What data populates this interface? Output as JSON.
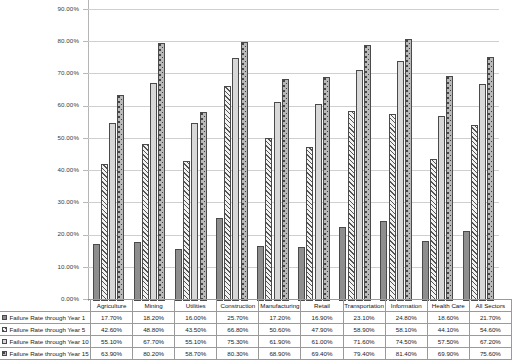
{
  "chart_data": {
    "type": "bar",
    "title": "",
    "xlabel": "",
    "ylabel": "",
    "ylim": [
      0,
      90
    ],
    "grid": true,
    "legend_position": "bottom-table",
    "categories": [
      "Agriculture",
      "Mining",
      "Utilities",
      "Construction",
      "Manufacturing",
      "Retail",
      "Transportation",
      "Information",
      "Health Care",
      "All Sectors"
    ],
    "ytick_labels": [
      "90.00%",
      "80.00%",
      "70.00%",
      "60.00%",
      "50.00%",
      "40.00%",
      "30.00%",
      "20.00%",
      "10.00%",
      "0.00%"
    ],
    "ytick_values": [
      90,
      80,
      70,
      60,
      50,
      40,
      30,
      20,
      10,
      0
    ],
    "series": [
      {
        "name": "Failure Rate through Year 1",
        "pattern": "solid-gray",
        "values": [
          17.7,
          18.2,
          16.0,
          25.7,
          17.2,
          16.9,
          23.1,
          24.8,
          18.6,
          21.7
        ],
        "labels": [
          "17.70%",
          "18.20%",
          "16.00%",
          "25.70%",
          "17.20%",
          "16.90%",
          "23.10%",
          "24.80%",
          "18.60%",
          "21.70%"
        ]
      },
      {
        "name": "Failure Rate through Year 5",
        "pattern": "diagonal-hatch",
        "values": [
          42.6,
          48.8,
          43.5,
          66.8,
          50.6,
          47.9,
          58.9,
          58.1,
          44.1,
          54.6
        ],
        "labels": [
          "42.60%",
          "48.80%",
          "43.50%",
          "66.80%",
          "50.60%",
          "47.90%",
          "58.90%",
          "58.10%",
          "44.10%",
          "54.60%"
        ]
      },
      {
        "name": "Failure Rate through Year 10",
        "pattern": "solid-light",
        "values": [
          55.1,
          67.7,
          55.1,
          75.3,
          61.9,
          61.0,
          71.6,
          74.5,
          57.5,
          67.2
        ],
        "labels": [
          "55.10%",
          "67.70%",
          "55.10%",
          "75.30%",
          "61.90%",
          "61.00%",
          "71.60%",
          "74.50%",
          "57.50%",
          "67.20%"
        ]
      },
      {
        "name": "Failure Rate through Year 15",
        "pattern": "dotted",
        "values": [
          63.9,
          80.2,
          58.7,
          80.3,
          68.9,
          69.4,
          79.4,
          81.4,
          69.9,
          75.6
        ],
        "labels": [
          "63.90%",
          "80.20%",
          "58.70%",
          "80.30%",
          "68.90%",
          "69.40%",
          "79.40%",
          "81.40%",
          "69.90%",
          "75.60%"
        ]
      }
    ],
    "colors": {
      "series_1": "#8e8e8e",
      "series_2": "#f2f2f2",
      "series_3": "#d8d8d8",
      "series_4": "#b9b9b9",
      "bar_outline": "#4a4a4a",
      "gridline": "#cfcfcf",
      "axis": "#8a8a8a",
      "table_border": "#9a9a9a"
    }
  }
}
